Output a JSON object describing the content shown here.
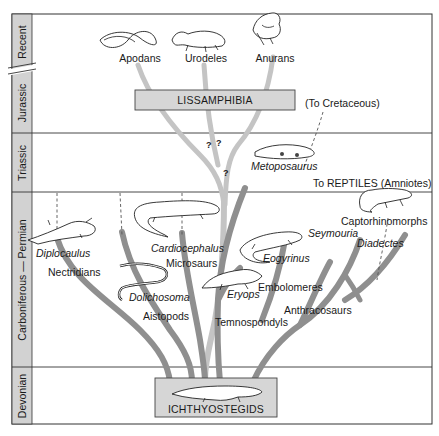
{
  "diagram": {
    "colors": {
      "branch": "#8f8f8f",
      "branch_light": "#c4c4c4",
      "period_column": "#d2d2d2",
      "box_fill": "#d6d6d6",
      "frame": "#333333"
    },
    "periods": [
      {
        "id": "recent",
        "label": "Recent"
      },
      {
        "id": "jurassic",
        "label": "Jurassic"
      },
      {
        "id": "triassic",
        "label": "Triassic"
      },
      {
        "id": "carb-perm",
        "label": "Carboniferous — Permian"
      },
      {
        "id": "devonian",
        "label": "Devonian"
      }
    ],
    "boxes": {
      "lissamphibia": "LISSAMPHIBIA",
      "ichthyostegids": "ICHTHYOSTEGIDS"
    },
    "groups": {
      "apodans": "Apodans",
      "urodeles": "Urodeles",
      "anurans": "Anurans",
      "nectridians": "Nectridians",
      "microsaurs": "Microsaurs",
      "aistopods": "Aistopods",
      "temnospondyls": "Temnospondyls",
      "embolomeres": "Embolomeres",
      "anthracosaurs": "Anthracosaurs",
      "captorhinomorphs": "Captorhinomorphs"
    },
    "genera": {
      "diplocaulus": "Diplocaulus",
      "cardiocephalus": "Cardiocephalus",
      "dolichosoma": "Dolichosoma",
      "eryops": "Eryops",
      "eogyrinus": "Eogyrinus",
      "seymouria": "Seymouria",
      "diadectes": "Diadectes",
      "metoposaurus": "Metoposaurus"
    },
    "annotations": {
      "to_cretaceous": "(To Cretaceous)",
      "to_reptiles": "To REPTILES (Amniotes)",
      "uncertain_1": "?",
      "uncertain_2": "?",
      "uncertain_3": "?"
    }
  }
}
